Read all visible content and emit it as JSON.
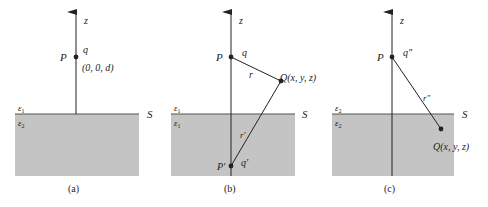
{
  "colors": {
    "medium_fill": "#c4c4c4",
    "line": "#222222",
    "background": "#ffffff"
  },
  "panels": [
    {
      "caption": "(a)",
      "axis_label": "z",
      "point_label": "P",
      "charge_label": "q",
      "coord_label": "(0, 0, d)",
      "upper_medium": "ε",
      "upper_medium_sub": "1",
      "lower_medium": "ε",
      "lower_medium_sub": "2",
      "surface_label": "S"
    },
    {
      "caption": "(b)",
      "axis_label": "z",
      "point_label": "P",
      "charge_label": "q",
      "field_point_label": "Q(x, y, z)",
      "distance_label": "r",
      "image_distance_label": "r'",
      "image_point_label": "P'",
      "image_charge_label": "q'",
      "upper_medium": "ε",
      "upper_medium_sub": "1",
      "lower_medium": "ε",
      "lower_medium_sub": "1",
      "surface_label": "S"
    },
    {
      "caption": "(c)",
      "axis_label": "z",
      "point_label": "P",
      "charge_label": "q\"",
      "distance_label": "r\"",
      "field_point_label": "Q(x, y, z)",
      "upper_medium": "ε",
      "upper_medium_sub": "2",
      "lower_medium": "ε",
      "lower_medium_sub": "2",
      "surface_label": "S"
    }
  ]
}
